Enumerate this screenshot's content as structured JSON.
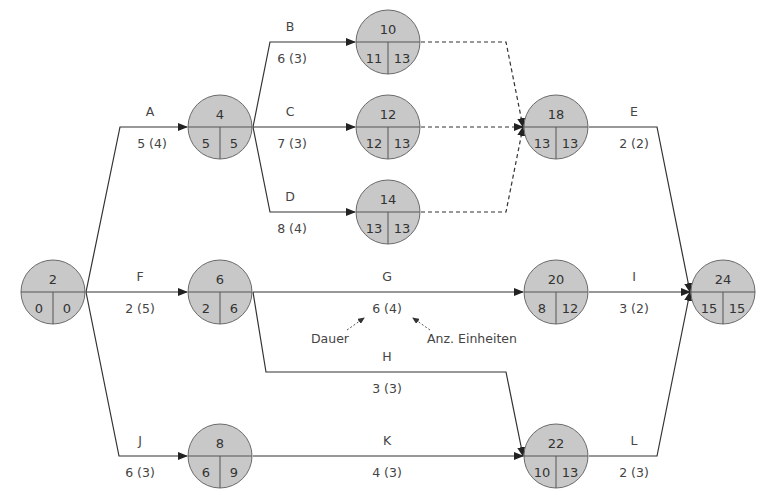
{
  "diagram": {
    "type": "network-plan",
    "nodes": [
      {
        "id": "n2",
        "number": "2",
        "left": "0",
        "right": "0",
        "cx": 53,
        "cy": 292
      },
      {
        "id": "n4",
        "number": "4",
        "left": "5",
        "right": "5",
        "cx": 220,
        "cy": 127
      },
      {
        "id": "n6",
        "number": "6",
        "left": "2",
        "right": "6",
        "cx": 220,
        "cy": 292
      },
      {
        "id": "n8",
        "number": "8",
        "left": "6",
        "right": "9",
        "cx": 220,
        "cy": 456
      },
      {
        "id": "n10",
        "number": "10",
        "left": "11",
        "right": "13",
        "cx": 388,
        "cy": 42
      },
      {
        "id": "n12",
        "number": "12",
        "left": "12",
        "right": "13",
        "cx": 388,
        "cy": 127
      },
      {
        "id": "n14",
        "number": "14",
        "left": "13",
        "right": "13",
        "cx": 388,
        "cy": 212
      },
      {
        "id": "n18",
        "number": "18",
        "left": "13",
        "right": "13",
        "cx": 556,
        "cy": 127
      },
      {
        "id": "n20",
        "number": "20",
        "left": "8",
        "right": "12",
        "cx": 556,
        "cy": 292
      },
      {
        "id": "n22",
        "number": "22",
        "left": "10",
        "right": "13",
        "cx": 556,
        "cy": 456
      },
      {
        "id": "n24",
        "number": "24",
        "left": "15",
        "right": "15",
        "cx": 723,
        "cy": 292
      }
    ],
    "activities": [
      {
        "name": "A",
        "duration_units": "5 (4)",
        "from": "2",
        "to": "4"
      },
      {
        "name": "B",
        "duration_units": "6 (3)",
        "from": "4",
        "to": "10"
      },
      {
        "name": "C",
        "duration_units": "7 (3)",
        "from": "4",
        "to": "12"
      },
      {
        "name": "D",
        "duration_units": "8 (4)",
        "from": "4",
        "to": "14"
      },
      {
        "name": "E",
        "duration_units": "2 (2)",
        "from": "18",
        "to": "24"
      },
      {
        "name": "F",
        "duration_units": "2 (5)",
        "from": "2",
        "to": "6"
      },
      {
        "name": "G",
        "duration_units": "6 (4)",
        "from": "6",
        "to": "20"
      },
      {
        "name": "H",
        "duration_units": "3 (3)",
        "from": "6",
        "to": "22"
      },
      {
        "name": "I",
        "duration_units": "3 (2)",
        "from": "20",
        "to": "24"
      },
      {
        "name": "J",
        "duration_units": "6 (3)",
        "from": "2",
        "to": "8"
      },
      {
        "name": "K",
        "duration_units": "4 (3)",
        "from": "8",
        "to": "22"
      },
      {
        "name": "L",
        "duration_units": "2 (3)",
        "from": "22",
        "to": "24"
      }
    ],
    "dummy_activities": [
      {
        "from": "10",
        "to": "18"
      },
      {
        "from": "12",
        "to": "18"
      },
      {
        "from": "14",
        "to": "18"
      }
    ],
    "legend": {
      "duration_label": "Dauer",
      "units_label": "Anz. Einheiten"
    }
  }
}
